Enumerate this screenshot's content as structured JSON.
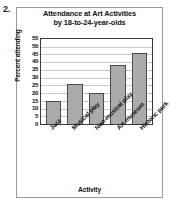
{
  "question_number": "2.",
  "chart_data": {
    "type": "bar",
    "title": "Attendance at Art Activities",
    "title_line2": "by 18-to-24-year-olds",
    "xlabel": "Activity",
    "ylabel": "Percent attending",
    "categories": [
      "Jazz",
      "Musical play",
      "Non-musical play",
      "Art museum",
      "Historic park"
    ],
    "values": [
      15,
      26,
      20,
      38,
      46
    ],
    "ylim": [
      0,
      55
    ],
    "ytick_step": 5,
    "yticks": [
      55,
      50,
      45,
      40,
      35,
      30,
      25,
      20,
      15,
      10,
      5,
      0
    ],
    "grid": true,
    "legend": "none",
    "bar_color": "#ababab",
    "bar_border_color": "#4a4a4a",
    "grid_color": "#c9c9c9",
    "axis_color": "#3a3a3a"
  }
}
